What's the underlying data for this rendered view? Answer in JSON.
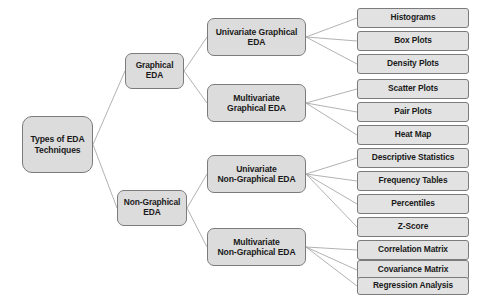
{
  "diagram": {
    "title": "Types of EDA Techniques",
    "type": "hierarchy-tree",
    "orientation": "left-to-right",
    "colors": {
      "node_fill": "#dcdcdc",
      "leaf_fill": "#e2e2e2",
      "node_border": "#7b7b7b",
      "connector": "#a9a9a9",
      "text": "#1a1a1a",
      "background": "#ffffff"
    },
    "root": {
      "id": "root",
      "label": "Types of EDA\nTechniques",
      "x": 22,
      "y": 116,
      "w": 71,
      "h": 57
    },
    "level1": [
      {
        "id": "graphical",
        "label": "Graphical\nEDA",
        "x": 125,
        "y": 53,
        "w": 59,
        "h": 36
      },
      {
        "id": "non-graphical",
        "label": "Non-Graphical\nEDA",
        "x": 117,
        "y": 190,
        "w": 70,
        "h": 36
      }
    ],
    "level2": [
      {
        "id": "univariate-graphical",
        "label": "Univariate Graphical\nEDA",
        "x": 207,
        "y": 18,
        "w": 99,
        "h": 38,
        "parent": "graphical"
      },
      {
        "id": "multivariate-graphical",
        "label": "Multivariate\nGraphical  EDA",
        "x": 207,
        "y": 84,
        "w": 99,
        "h": 38,
        "parent": "graphical"
      },
      {
        "id": "univariate-non-graphical",
        "label": "Univariate\nNon-Graphical EDA",
        "x": 207,
        "y": 155,
        "w": 99,
        "h": 38,
        "parent": "non-graphical"
      },
      {
        "id": "multivariate-non-graphical",
        "label": "Multivariate\nNon-Graphical EDA",
        "x": 207,
        "y": 228,
        "w": 99,
        "h": 38,
        "parent": "non-graphical"
      }
    ],
    "leaves": [
      {
        "id": "histograms",
        "label": "Histograms",
        "x": 357,
        "y": 8,
        "w": 112,
        "h": 20,
        "parent": "univariate-graphical"
      },
      {
        "id": "box-plots",
        "label": "Box Plots",
        "x": 357,
        "y": 31,
        "w": 112,
        "h": 20,
        "parent": "univariate-graphical"
      },
      {
        "id": "density-plots",
        "label": "Density Plots",
        "x": 357,
        "y": 54,
        "w": 112,
        "h": 20,
        "parent": "univariate-graphical"
      },
      {
        "id": "scatter-plots",
        "label": "Scatter Plots",
        "x": 357,
        "y": 79,
        "w": 112,
        "h": 20,
        "parent": "multivariate-graphical"
      },
      {
        "id": "pair-plots",
        "label": "Pair Plots",
        "x": 357,
        "y": 102,
        "w": 112,
        "h": 20,
        "parent": "multivariate-graphical"
      },
      {
        "id": "heat-map",
        "label": "Heat Map",
        "x": 357,
        "y": 125,
        "w": 112,
        "h": 20,
        "parent": "multivariate-graphical"
      },
      {
        "id": "descriptive-statistics",
        "label": "Descriptive Statistics",
        "x": 357,
        "y": 148,
        "w": 112,
        "h": 20,
        "parent": "univariate-non-graphical"
      },
      {
        "id": "frequency-tables",
        "label": "Frequency Tables",
        "x": 357,
        "y": 171,
        "w": 112,
        "h": 20,
        "parent": "univariate-non-graphical"
      },
      {
        "id": "percentiles",
        "label": "Percentiles",
        "x": 357,
        "y": 194,
        "w": 112,
        "h": 20,
        "parent": "univariate-non-graphical"
      },
      {
        "id": "z-score",
        "label": "Z-Score",
        "x": 357,
        "y": 217,
        "w": 112,
        "h": 20,
        "parent": "univariate-non-graphical"
      },
      {
        "id": "correlation-matrix",
        "label": "Correlation Matrix",
        "x": 357,
        "y": 240,
        "w": 112,
        "h": 20,
        "parent": "multivariate-non-graphical"
      },
      {
        "id": "covariance-matrix",
        "label": "Covariance Matrix",
        "x": 357,
        "y": 260,
        "w": 112,
        "h": 20,
        "parent": "multivariate-non-graphical"
      },
      {
        "id": "regression-analysis",
        "label": "Regression Analysis",
        "x": 357,
        "y": 277,
        "w": 112,
        "h": 18,
        "parent": "multivariate-non-graphical"
      }
    ]
  }
}
